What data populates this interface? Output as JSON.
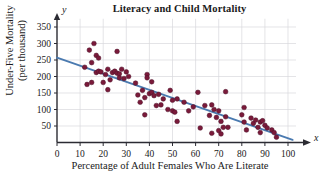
{
  "chart_data": {
    "type": "scatter",
    "title": "Literacy and Child Mortality",
    "xlabel": "Percentage of Adult Females Who Are Literate",
    "ylabel_line1": "Under-Five Mortality",
    "ylabel_line2": "(per thousand)",
    "x_var_symbol": "x",
    "y_var_symbol": "y",
    "xlim": [
      0,
      100
    ],
    "ylim": [
      0,
      375
    ],
    "grid": true,
    "legend": "none",
    "xticks": [
      0,
      10,
      20,
      30,
      40,
      50,
      60,
      70,
      80,
      90,
      100
    ],
    "yticks": [
      50,
      100,
      150,
      200,
      250,
      300,
      350
    ],
    "point_color": "#7a1a3a",
    "line_color": "#4a7ab0",
    "grid_color": "#d8d8dc",
    "axis_color": "#2b2b33",
    "trend_line": {
      "label": "least-squares regression line",
      "x_start": 0,
      "y_start": 257,
      "x_end": 102,
      "y_end": 8
    },
    "points": [
      [
        12,
        228
      ],
      [
        13,
        176
      ],
      [
        14,
        280
      ],
      [
        15,
        242
      ],
      [
        15,
        182
      ],
      [
        16,
        300
      ],
      [
        17,
        264
      ],
      [
        17,
        212
      ],
      [
        18,
        216
      ],
      [
        18,
        256
      ],
      [
        19,
        214
      ],
      [
        20,
        182
      ],
      [
        21,
        206
      ],
      [
        22,
        160
      ],
      [
        22,
        222
      ],
      [
        23,
        190
      ],
      [
        24,
        212
      ],
      [
        25,
        216
      ],
      [
        26,
        210
      ],
      [
        26,
        276
      ],
      [
        27,
        208
      ],
      [
        27,
        196
      ],
      [
        28,
        222
      ],
      [
        29,
        194
      ],
      [
        30,
        214
      ],
      [
        31,
        200
      ],
      [
        34,
        180
      ],
      [
        35,
        144
      ],
      [
        36,
        122
      ],
      [
        37,
        158
      ],
      [
        38,
        136
      ],
      [
        38,
        84
      ],
      [
        39,
        206
      ],
      [
        39,
        196
      ],
      [
        40,
        148
      ],
      [
        41,
        184
      ],
      [
        41,
        152
      ],
      [
        42,
        142
      ],
      [
        43,
        112
      ],
      [
        44,
        146
      ],
      [
        45,
        114
      ],
      [
        46,
        132
      ],
      [
        48,
        100
      ],
      [
        49,
        158
      ],
      [
        50,
        96
      ],
      [
        50,
        128
      ],
      [
        51,
        92
      ],
      [
        52,
        64
      ],
      [
        52,
        132
      ],
      [
        55,
        122
      ],
      [
        57,
        96
      ],
      [
        59,
        108
      ],
      [
        61,
        152
      ],
      [
        62,
        44
      ],
      [
        64,
        112
      ],
      [
        66,
        82
      ],
      [
        67,
        114
      ],
      [
        67,
        28
      ],
      [
        68,
        100
      ],
      [
        69,
        76
      ],
      [
        70,
        96
      ],
      [
        70,
        36
      ],
      [
        71,
        26
      ],
      [
        71,
        64
      ],
      [
        72,
        46
      ],
      [
        73,
        154
      ],
      [
        73,
        78
      ],
      [
        74,
        46
      ],
      [
        80,
        84
      ],
      [
        81,
        106
      ],
      [
        81,
        62
      ],
      [
        82,
        38
      ],
      [
        84,
        74
      ],
      [
        85,
        58
      ],
      [
        86,
        68
      ],
      [
        87,
        46
      ],
      [
        88,
        62
      ],
      [
        88,
        30
      ],
      [
        89,
        66
      ],
      [
        90,
        52
      ],
      [
        91,
        44
      ],
      [
        93,
        38
      ],
      [
        94,
        30
      ],
      [
        95,
        16
      ]
    ]
  }
}
